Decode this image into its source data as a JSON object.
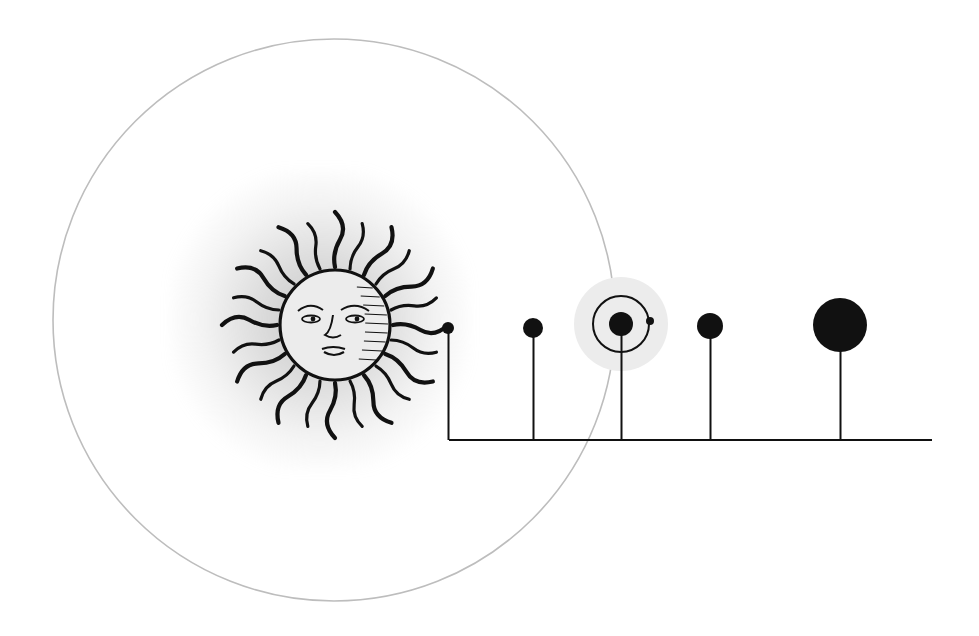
{
  "diagram": {
    "type": "solar-system-scale-diagram",
    "colors": {
      "background": "#ffffff",
      "ink": "#111111",
      "orbit_circle": "#bdbdbd",
      "earth_halo": "#ececec",
      "sun_glow": "#9a9a9a"
    },
    "sun": {
      "name": "sun-engraving",
      "cx": 335,
      "cy": 325,
      "face_r": 55,
      "ray_r": 113,
      "ray_count": 24
    },
    "large_circle": {
      "cx": 334,
      "cy": 320,
      "r": 281
    },
    "baseline": {
      "x1": 449,
      "x2": 932,
      "y": 440
    },
    "planets": [
      {
        "name": "mercury",
        "cx": 448,
        "cy": 328,
        "r": 6
      },
      {
        "name": "venus",
        "cx": 533,
        "cy": 328,
        "r": 10
      },
      {
        "name": "earth",
        "cx": 621,
        "cy": 324,
        "r": 12,
        "halo_r": 47,
        "orbit_r": 28,
        "moon": {
          "cx": 650,
          "cy": 321,
          "r": 4
        }
      },
      {
        "name": "mars",
        "cx": 710,
        "cy": 326,
        "r": 13
      },
      {
        "name": "jupiter",
        "cx": 840,
        "cy": 325,
        "r": 27
      }
    ]
  }
}
